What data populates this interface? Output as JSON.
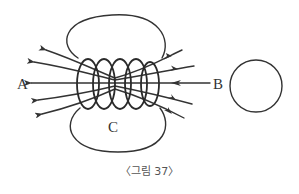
{
  "figure": {
    "labels": {
      "left_pole": "A",
      "right_pole": "B",
      "field_region": "C"
    },
    "caption": "〈그림 37〉",
    "colors": {
      "line": "#333333",
      "caption": "#555555",
      "background": "#ffffff"
    }
  }
}
